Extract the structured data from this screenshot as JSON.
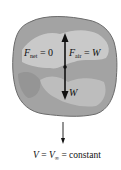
{
  "diagram": {
    "labels": {
      "fnet_symbol": "F",
      "fnet_sub": "net",
      "fnet_rest": " = 0",
      "fair_symbol": "F",
      "fair_sub": "air",
      "fair_rest": " = ",
      "fair_value": "W",
      "weight": "W",
      "v_symbol": "V",
      "v_eq": " = ",
      "vinf_symbol": "V",
      "vinf_sub": "∞",
      "v_rest": " = constant"
    },
    "colors": {
      "body_fill": "#a3a3a3",
      "body_highlight": "#c9c9c9",
      "body_outline": "#6b6b6b",
      "arrow": "#111111",
      "text": "#111111"
    },
    "elements": [
      {
        "type": "body",
        "shape": "irregular-rock"
      },
      {
        "type": "force-arrow",
        "direction": "up",
        "label": "F_air = W"
      },
      {
        "type": "force-arrow",
        "direction": "down",
        "label": "W"
      },
      {
        "type": "velocity-arrow",
        "direction": "down",
        "label": "V = V∞ = constant"
      }
    ]
  }
}
